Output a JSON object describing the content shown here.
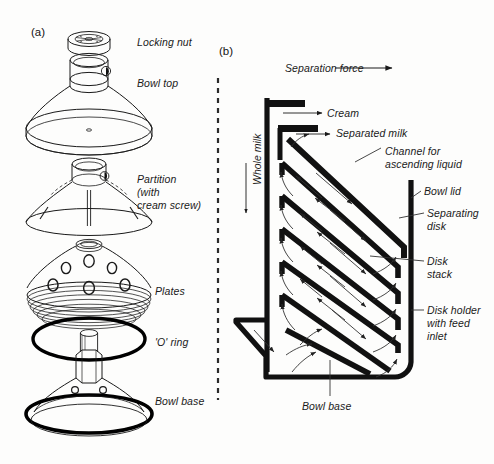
{
  "figure": {
    "panels": [
      {
        "tag": "(a)",
        "title_role": "exploded-view-of-separator-bowl"
      },
      {
        "tag": "(b)",
        "title_role": "cross-section-of-separation-process"
      }
    ]
  },
  "panel_a": {
    "tag": "(a)",
    "labels": [
      {
        "id": "locking-nut",
        "text": "Locking nut"
      },
      {
        "id": "bowl-top",
        "text": "Bowl top"
      },
      {
        "id": "partition-1",
        "text": "Partition"
      },
      {
        "id": "partition-2",
        "text": "(with"
      },
      {
        "id": "partition-3",
        "text": "cream screw)"
      },
      {
        "id": "plates",
        "text": "Plates"
      },
      {
        "id": "o-ring",
        "text": "'O' ring"
      },
      {
        "id": "bowl-base",
        "text": "Bowl base"
      }
    ]
  },
  "panel_b": {
    "tag": "(b)",
    "labels": [
      {
        "id": "separation-force",
        "text": "Separation force"
      },
      {
        "id": "whole-milk",
        "text": "Whole milk"
      },
      {
        "id": "cream",
        "text": "Cream"
      },
      {
        "id": "separated-milk",
        "text": "Separated milk"
      },
      {
        "id": "channel-1",
        "text": "Channel for"
      },
      {
        "id": "channel-2",
        "text": "ascending liquid"
      },
      {
        "id": "bowl-lid",
        "text": "Bowl lid"
      },
      {
        "id": "separating-disk-1",
        "text": "Separating"
      },
      {
        "id": "separating-disk-2",
        "text": "disk"
      },
      {
        "id": "disk-stack-1",
        "text": "Disk"
      },
      {
        "id": "disk-stack-2",
        "text": "stack"
      },
      {
        "id": "disk-holder-1",
        "text": "Disk holder"
      },
      {
        "id": "disk-holder-2",
        "text": "with feed"
      },
      {
        "id": "disk-holder-3",
        "text": "inlet"
      },
      {
        "id": "bowl-base",
        "text": "Bowl base"
      }
    ]
  },
  "colors": {
    "ink": "#000000",
    "line": "#1a1a1a",
    "background": "#fdfdfc",
    "arrow": "#555555"
  }
}
